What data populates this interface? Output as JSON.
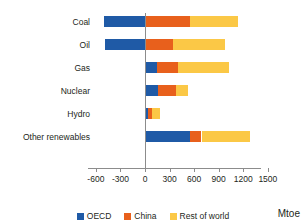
{
  "chart_data": {
    "type": "bar",
    "orientation": "horizontal",
    "stacked": true,
    "title": "",
    "subtitle": "",
    "xlabel": "Mtoe",
    "ylabel": "",
    "xlim": [
      -600,
      1500
    ],
    "xticks": [
      -600,
      -300,
      0,
      300,
      600,
      900,
      1200,
      1500
    ],
    "xtick_labels": [
      "-600",
      "-300",
      "0",
      "300",
      "600",
      "900",
      "1200",
      "1500"
    ],
    "grid": false,
    "legend_position": "bottom",
    "categories": [
      "Coal",
      "Oil",
      "Gas",
      "Nuclear",
      "Hydro",
      "Other renewables"
    ],
    "series": [
      {
        "name": "OECD",
        "color": "#1f5aa6",
        "values": [
          -500,
          -490,
          150,
          160,
          40,
          550
        ]
      },
      {
        "name": "China",
        "color": "#e8601c",
        "values": [
          550,
          340,
          250,
          220,
          50,
          140
        ]
      },
      {
        "name": "Rest of world",
        "color": "#fbc846",
        "values": [
          590,
          640,
          620,
          150,
          90,
          590
        ]
      }
    ],
    "totals": [
      640,
      490,
      1020,
      530,
      180,
      1280
    ]
  },
  "axis": {
    "unit_label": "Mtoe"
  },
  "legend": {
    "items": [
      {
        "label": "OECD",
        "color": "#1f5aa6",
        "swatch_name": "legend-swatch-oecd"
      },
      {
        "label": "China",
        "color": "#e8601c",
        "swatch_name": "legend-swatch-china"
      },
      {
        "label": "Rest of world",
        "color": "#fbc846",
        "swatch_name": "legend-swatch-rest-of-world"
      }
    ]
  }
}
